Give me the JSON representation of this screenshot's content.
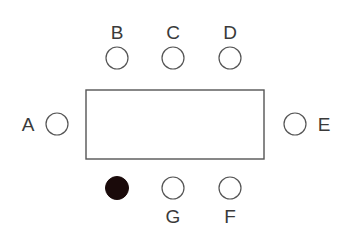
{
  "diagram": {
    "table": {
      "x": 86,
      "y": 90,
      "width": 178,
      "height": 69
    },
    "seats": [
      {
        "label": "A",
        "cx": 57,
        "cy": 124,
        "filled": false,
        "label_x": 28,
        "label_y": 131
      },
      {
        "label": "B",
        "cx": 117,
        "cy": 58,
        "filled": false,
        "label_x": 117,
        "label_y": 39
      },
      {
        "label": "C",
        "cx": 173,
        "cy": 58,
        "filled": false,
        "label_x": 173,
        "label_y": 39
      },
      {
        "label": "D",
        "cx": 230,
        "cy": 58,
        "filled": false,
        "label_x": 230,
        "label_y": 39
      },
      {
        "label": "E",
        "cx": 295,
        "cy": 124,
        "filled": false,
        "label_x": 324,
        "label_y": 131
      },
      {
        "label": "F",
        "cx": 230,
        "cy": 188,
        "filled": false,
        "label_x": 230,
        "label_y": 223
      },
      {
        "label": "G",
        "cx": 173,
        "cy": 188,
        "filled": false,
        "label_x": 173,
        "label_y": 223
      },
      {
        "label": "",
        "cx": 117,
        "cy": 188,
        "filled": true
      }
    ],
    "colors": {
      "stroke": "#555555",
      "filled": "#1a0a0a",
      "text": "#3a3a3a"
    }
  }
}
